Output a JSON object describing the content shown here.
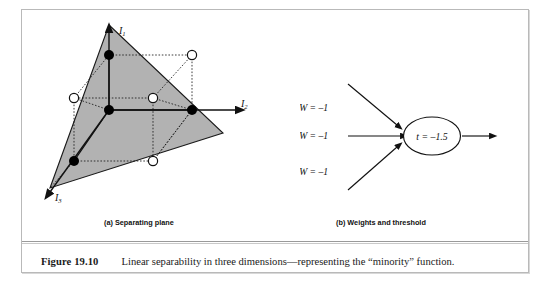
{
  "figure": {
    "number_label": "Figure 19.10",
    "caption_text": "Linear separability in three dimensions—representing the “minority” function.",
    "panel_a_caption": "(a) Separating plane",
    "panel_b_caption": "(b) Weights and threshold"
  },
  "panel_a": {
    "axes": [
      {
        "name": "axis-i1",
        "label": "I",
        "subscript": "1"
      },
      {
        "name": "axis-i2",
        "label": "I",
        "subscript": "2"
      },
      {
        "name": "axis-i3",
        "label": "I",
        "subscript": "3"
      }
    ],
    "plane_fill": "#b2b2b2",
    "plane_stroke": "#1a1a1a",
    "filled_point_color": "#000000",
    "open_point_color": "#ffffff",
    "vertices": [
      {
        "name": "origin",
        "type": "filled",
        "x": 109,
        "y": 122
      },
      {
        "name": "i1-unit",
        "type": "filled",
        "x": 109,
        "y": 67
      },
      {
        "name": "i2-unit",
        "type": "filled",
        "x": 192,
        "y": 122
      },
      {
        "name": "i3-unit",
        "type": "filled",
        "x": 74,
        "y": 173
      },
      {
        "name": "i1-i2",
        "type": "open",
        "x": 192,
        "y": 67
      },
      {
        "name": "i1-i3",
        "type": "open",
        "x": 74,
        "y": 110
      },
      {
        "name": "i2-i3",
        "type": "open",
        "x": 153,
        "y": 173
      },
      {
        "name": "i1-i2-i3",
        "type": "open",
        "x": 153,
        "y": 110
      }
    ]
  },
  "panel_b": {
    "weights": [
      {
        "name": "weight-1",
        "text": "W = –1"
      },
      {
        "name": "weight-2",
        "text": "W = –1"
      },
      {
        "name": "weight-3",
        "text": "W = –1"
      }
    ],
    "threshold": {
      "name": "threshold",
      "text": "t = –1.5"
    },
    "node_fill": "#ffffff",
    "node_stroke": "#111111",
    "arrow_color": "#111111"
  }
}
